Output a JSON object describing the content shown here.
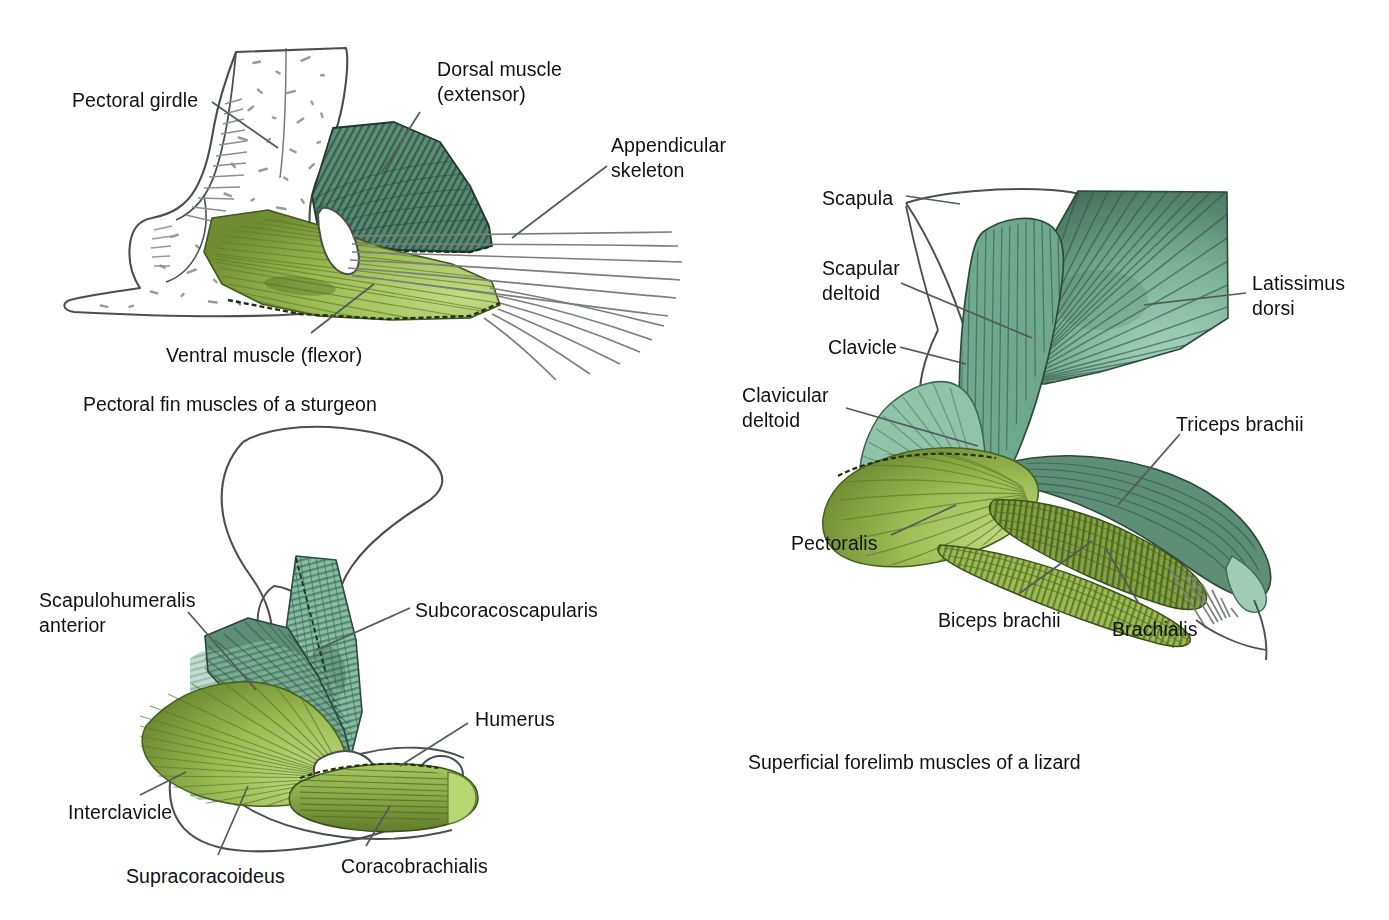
{
  "figure": {
    "top_cut_text": "(gills) Dorsal and ventral portions of the",
    "colors": {
      "ink": "#4b4f4b",
      "ink_dark": "#2b2e2b",
      "dark_teal": "#4a7a66",
      "mid_teal": "#6fa98d",
      "light_teal": "#8fc4aa",
      "pale_teal": "#a8d3bd",
      "olive_dark": "#6f8a33",
      "olive": "#8aa84a",
      "olive_light": "#a8c45f",
      "pale_green": "#bcd77a",
      "bone_white": "#ffffff",
      "stipple": "#8c8f8c"
    }
  },
  "panels": {
    "sturgeon": {
      "caption": "Pectoral fin muscles of a sturgeon",
      "labels": [
        {
          "id": "pectoral-girdle",
          "text": "Pectoral girdle",
          "x": 72,
          "y": 88
        },
        {
          "id": "dorsal-muscle",
          "text": "Dorsal muscle\n(extensor)",
          "x": 437,
          "y": 57
        },
        {
          "id": "appendicular-skeleton",
          "text": "Appendicular\nskeleton",
          "x": 611,
          "y": 133
        },
        {
          "id": "ventral-muscle",
          "text": "Ventral muscle (flexor)",
          "x": 166,
          "y": 343
        }
      ]
    },
    "salamander": {
      "caption": "",
      "labels": [
        {
          "id": "scapulohumeralis-anterior",
          "text": "Scapulohumeralis\nanterior",
          "x": 39,
          "y": 588
        },
        {
          "id": "subcoracoscapularis",
          "text": "Subcoracoscapularis",
          "x": 415,
          "y": 598
        },
        {
          "id": "humerus",
          "text": "Humerus",
          "x": 475,
          "y": 707
        },
        {
          "id": "interclavicle",
          "text": "Interclavicle",
          "x": 68,
          "y": 800
        },
        {
          "id": "supracoracoideus",
          "text": "Supracoracoideus",
          "x": 126,
          "y": 864
        },
        {
          "id": "coracobrachialis",
          "text": "Coracobrachialis",
          "x": 341,
          "y": 854
        }
      ]
    },
    "lizard": {
      "caption": "Superficial forelimb muscles of a lizard",
      "labels": [
        {
          "id": "scapula",
          "text": "Scapula",
          "x": 822,
          "y": 186
        },
        {
          "id": "scapular-deltoid",
          "text": "Scapular\ndeltoid",
          "x": 822,
          "y": 256
        },
        {
          "id": "clavicle",
          "text": "Clavicle",
          "x": 828,
          "y": 335
        },
        {
          "id": "clavicular-deltoid",
          "text": "Clavicular\ndeltoid",
          "x": 742,
          "y": 383
        },
        {
          "id": "latissimus-dorsi",
          "text": "Latissimus\ndorsi",
          "x": 1252,
          "y": 271
        },
        {
          "id": "triceps-brachii",
          "text": "Triceps brachii",
          "x": 1176,
          "y": 412
        },
        {
          "id": "pectoralis",
          "text": "Pectoralis",
          "x": 791,
          "y": 531
        },
        {
          "id": "biceps-brachii",
          "text": "Biceps brachii",
          "x": 938,
          "y": 608
        },
        {
          "id": "brachialis",
          "text": "Brachialis",
          "x": 1112,
          "y": 617
        }
      ]
    }
  },
  "captions": {
    "sturgeon_caption": {
      "text": "Pectoral fin muscles of a sturgeon",
      "x": 83,
      "y": 392
    },
    "lizard_caption": {
      "text": "Superficial forelimb muscles of a lizard",
      "x": 748,
      "y": 750
    }
  }
}
